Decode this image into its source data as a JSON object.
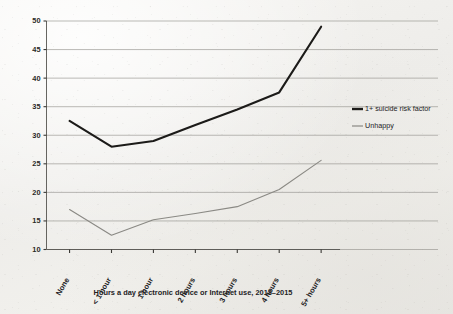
{
  "chart_data": {
    "type": "line",
    "title": "",
    "subtitle": "",
    "xlabel": "Hours a day electronic device or Internet use, 2013–2015",
    "ylabel": "",
    "categories": [
      "None",
      "< 1 hour",
      "1 hour",
      "2 hours",
      "3 hours",
      "4 hours",
      "5+ hours"
    ],
    "series": [
      {
        "name": "1+ suicide risk factor",
        "color": "#1c1b19",
        "values": [
          32.5,
          28.0,
          29.0,
          31.8,
          34.5,
          37.5,
          49.0
        ]
      },
      {
        "name": "Unhappy",
        "color": "#8a8984",
        "values": [
          17.0,
          12.5,
          15.2,
          16.3,
          17.5,
          20.5,
          25.6
        ]
      }
    ],
    "ylim": [
      10,
      50
    ],
    "ytick_labels": [
      "10",
      "15",
      "20",
      "25",
      "30",
      "35",
      "40",
      "45",
      "50"
    ],
    "ytick_values": [
      10,
      15,
      20,
      25,
      30,
      35,
      40,
      45,
      50
    ],
    "grid": true,
    "grid_axis": "y",
    "legend_position": "right",
    "xtick_rotation": -60
  },
  "legend": {
    "entries": [
      {
        "label": "1+ suicide risk factor",
        "swatch_color": "#1c1b19",
        "swatch_thickness": "thick"
      },
      {
        "label": "Unhappy",
        "swatch_color": "#8a8984",
        "swatch_thickness": "thin"
      }
    ]
  },
  "axes": {
    "x_title": "Hours a day electronic device or Internet use, 2013–2015"
  },
  "colors": {
    "background": "#f2f1ee",
    "series_dark": "#1c1b19",
    "series_gray": "#8a8984",
    "grid": "#8e8d88",
    "axis": "#55544f",
    "text": "#23221f"
  }
}
